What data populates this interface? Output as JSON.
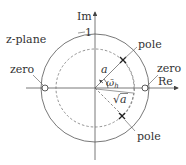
{
  "diagram": {
    "title": "z-plane",
    "axes": {
      "imag_label": "Im",
      "real_label": "Re"
    },
    "unit_circle_label": "1",
    "labels": {
      "zero_left": "zero",
      "zero_right": "zero",
      "pole_top": "pole",
      "pole_bottom": "pole",
      "radius_a": "a",
      "sqrt": "√",
      "sqrt_arg": "a",
      "omega": "ω̄",
      "omega_sub": "h"
    },
    "colors": {
      "line": "#444444",
      "text": "#333333",
      "background": "#ffffff"
    }
  }
}
